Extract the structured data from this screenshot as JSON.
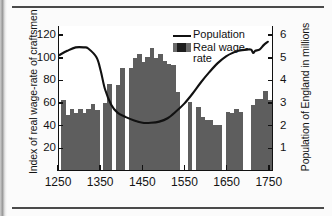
{
  "figure": {
    "left_axis_label": "Index of real wage-rate of craftsmen",
    "right_axis_label": "Population of England in millions"
  },
  "legend": {
    "position": "top-center",
    "items": [
      {
        "label": "Population",
        "marker": "line",
        "color": "#111111"
      },
      {
        "label": "Real wage-\nrate",
        "marker": "filled-box",
        "color": "#5e5e5e"
      }
    ]
  },
  "chart_data": {
    "type": "bar",
    "title": "",
    "xlabel": "",
    "ylabel": "Index of real wage-rate of craftsmen",
    "y2label": "Population of England in millions",
    "xlim": [
      1250,
      1760
    ],
    "ylim": [
      0,
      128
    ],
    "y2lim": [
      0,
      6.4
    ],
    "grid": false,
    "x_ticks": [
      1250,
      1350,
      1450,
      1550,
      1650,
      1750
    ],
    "x_tick_labels": [
      "1250",
      "1350",
      "1450",
      "1550",
      "1650",
      "1750"
    ],
    "y_ticks": [
      20,
      40,
      60,
      80,
      100,
      120
    ],
    "y_tick_labels": [
      "20",
      "40",
      "60",
      "80",
      "100",
      "120"
    ],
    "y2_ticks": [
      1,
      2,
      3,
      4,
      5,
      6
    ],
    "y2_tick_labels": [
      "1",
      "2",
      "3",
      "4",
      "5",
      "6"
    ],
    "series": [
      {
        "name": "Real wage-rate",
        "type": "bar",
        "axis": "left",
        "color": "#5e5e5e",
        "bar_width_years": 10,
        "x": [
          1260,
          1270,
          1280,
          1290,
          1300,
          1310,
          1320,
          1330,
          1340,
          1360,
          1370,
          1390,
          1400,
          1420,
          1430,
          1440,
          1450,
          1460,
          1470,
          1480,
          1490,
          1500,
          1510,
          1520,
          1530,
          1560,
          1580,
          1590,
          1600,
          1610,
          1620,
          1630,
          1650,
          1660,
          1670,
          1680,
          1710,
          1720,
          1730,
          1740,
          1750
        ],
        "values": [
          62,
          49,
          54,
          50,
          54,
          50,
          54,
          58,
          53,
          59,
          76,
          75,
          90,
          90,
          99,
          102,
          95,
          100,
          108,
          99,
          102,
          96,
          94,
          93,
          69,
          60,
          56,
          47,
          44,
          44,
          40,
          40,
          51,
          50,
          54,
          51,
          57,
          63,
          63,
          70,
          62
        ]
      },
      {
        "name": "Population",
        "type": "line",
        "axis": "right",
        "color": "#111111",
        "x": [
          1250,
          1270,
          1290,
          1310,
          1320,
          1340,
          1350,
          1360,
          1375,
          1390,
          1410,
          1430,
          1450,
          1470,
          1490,
          1510,
          1530,
          1550,
          1570,
          1590,
          1610,
          1630,
          1650,
          1665,
          1680,
          1700,
          1710,
          1715,
          1720,
          1730,
          1740,
          1750
        ],
        "values": [
          5.1,
          5.3,
          5.45,
          5.45,
          5.4,
          5.0,
          4.4,
          3.6,
          2.9,
          2.55,
          2.35,
          2.2,
          2.1,
          2.1,
          2.15,
          2.3,
          2.6,
          2.95,
          3.4,
          3.9,
          4.35,
          4.75,
          5.05,
          5.2,
          5.3,
          5.35,
          5.35,
          5.2,
          5.3,
          5.35,
          5.55,
          5.7
        ]
      }
    ]
  }
}
